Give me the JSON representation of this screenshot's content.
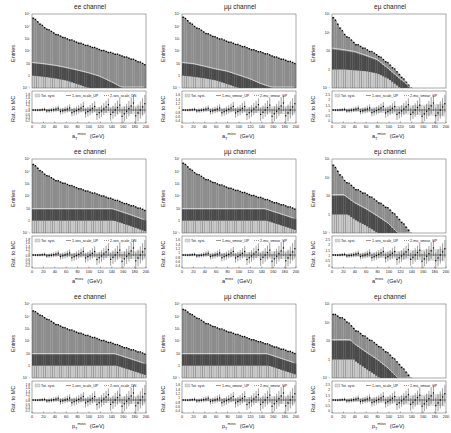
{
  "figure": {
    "rows": [
      {
        "xlabel": "a_T^miss (GeV)",
        "xlabel_main": "a",
        "xlabel_sup": "miss",
        "xlabel_sub": "T",
        "xlabel_unit": "(GeV)"
      },
      {
        "xlabel": "a^miss (GeV)",
        "xlabel_main": "a",
        "xlabel_sup": "miss",
        "xlabel_sub": "",
        "xlabel_unit": "(GeV)"
      },
      {
        "xlabel": "p_T^miss (GeV)",
        "xlabel_main": "p",
        "xlabel_sup": "miss",
        "xlabel_sub": "T",
        "xlabel_unit": "(GeV)"
      }
    ],
    "columns": [
      {
        "title": "ee channel",
        "legend": [
          "Tot. syst.",
          "1-ses_scale_UP",
          "2-ses_scale_DN"
        ],
        "ratio_ticks": [
          "0.2",
          "0.4",
          "0.6",
          "0.8",
          "1",
          "1.2",
          "1.4",
          "1.6",
          "1.8"
        ]
      },
      {
        "title": "μμ channel",
        "legend": [
          "Tot. syst.",
          "1-mu_smear_UP",
          "2-mu_smear_UP"
        ],
        "ratio_ticks": [
          "0.4",
          "0.6",
          "0.8",
          "1",
          "1.2",
          "1.4",
          "1.6"
        ]
      },
      {
        "title": "eμ channel",
        "legend": [
          "Tot. syst.",
          "1-ses_scale_UP",
          "2-mu_smear_UP"
        ],
        "ratio_ticks": [
          "0",
          "0.5",
          "1",
          "1.5",
          "2",
          "2.5"
        ]
      }
    ],
    "ylabel_main": "Entries",
    "ylabel_ratio": "Rat. to MC",
    "x_ticks": [
      "0",
      "20",
      "40",
      "60",
      "80",
      "100",
      "120",
      "140",
      "160",
      "180",
      "200"
    ],
    "y_ticks_log": [
      "10⁻¹",
      "1",
      "10",
      "10²",
      "10³",
      "10⁴",
      "10⁵"
    ]
  },
  "chart_data": [
    {
      "type": "bar",
      "title": "ee channel",
      "xlabel": "a_T^miss (GeV)",
      "ylabel": "Entries",
      "yscale": "log",
      "xlim": [
        0,
        200
      ],
      "ylim": [
        0.1,
        100000
      ],
      "series": [
        {
          "name": "total MC (stacked)",
          "values": [
            50000,
            8000,
            2500,
            1000,
            500,
            250,
            130,
            70,
            40,
            20,
            8
          ]
        },
        {
          "name": "dark component",
          "values": [
            10,
            8,
            6,
            4,
            2.5,
            1.5,
            0.8,
            0.3,
            0.1,
            0.1,
            0.1
          ]
        },
        {
          "name": "light component",
          "values": [
            1,
            0.8,
            0.6,
            0.4,
            0.2,
            0.1,
            0.1,
            0.1,
            0.1,
            0.1,
            0.1
          ]
        }
      ],
      "categories": [
        "0",
        "20",
        "40",
        "60",
        "80",
        "100",
        "120",
        "140",
        "160",
        "180",
        "200"
      ],
      "ratio_ylim": [
        0.2,
        1.8
      ]
    },
    {
      "type": "bar",
      "title": "μμ channel",
      "xlabel": "a_T^miss (GeV)",
      "ylabel": "Entries",
      "yscale": "log",
      "xlim": [
        0,
        200
      ],
      "ylim": [
        0.1,
        100000
      ],
      "series": [
        {
          "name": "total MC (stacked)",
          "values": [
            60000,
            10000,
            3000,
            1200,
            600,
            300,
            150,
            80,
            40,
            20,
            10
          ]
        },
        {
          "name": "dark component",
          "values": [
            10,
            8,
            5,
            3,
            2,
            1,
            0.5,
            0.2,
            0.1,
            0.1,
            0.1
          ]
        },
        {
          "name": "light component",
          "values": [
            1,
            0.8,
            0.6,
            0.4,
            0.2,
            0.1,
            0.1,
            0.1,
            0.1,
            0.1,
            0.1
          ]
        }
      ],
      "categories": [
        "0",
        "20",
        "40",
        "60",
        "80",
        "100",
        "120",
        "140",
        "160",
        "180",
        "200"
      ],
      "ratio_ylim": [
        0.4,
        1.6
      ]
    },
    {
      "type": "bar",
      "title": "eμ channel",
      "xlabel": "a_T^miss (GeV)",
      "ylabel": "Entries",
      "yscale": "log",
      "xlim": [
        0,
        200
      ],
      "ylim": [
        0.1,
        1000
      ],
      "series": [
        {
          "name": "total MC (stacked)",
          "values": [
            700,
            80,
            25,
            12,
            6,
            2,
            0.5,
            0.1,
            0.1,
            0.1,
            0.1
          ]
        },
        {
          "name": "dark component",
          "values": [
            12,
            10,
            8,
            5,
            3,
            1,
            0.3,
            0.1,
            0.1,
            0.1,
            0.1
          ]
        },
        {
          "name": "light component",
          "values": [
            1,
            1,
            0.9,
            0.8,
            0.6,
            0.3,
            0.1,
            0.1,
            0.1,
            0.1,
            0.1
          ]
        }
      ],
      "categories": [
        "0",
        "20",
        "40",
        "60",
        "80",
        "100",
        "120",
        "140",
        "160",
        "180",
        "200"
      ],
      "ratio_ylim": [
        0,
        2.5
      ]
    },
    {
      "type": "bar",
      "title": "ee channel",
      "xlabel": "a^miss (GeV)",
      "ylabel": "Entries",
      "yscale": "log",
      "xlim": [
        0,
        200
      ],
      "ylim": [
        0.1,
        100000
      ],
      "series": [
        {
          "name": "total MC (stacked)",
          "values": [
            40000,
            6000,
            2000,
            900,
            450,
            220,
            120,
            60,
            30,
            15,
            7
          ]
        }
      ],
      "categories": [
        "0",
        "20",
        "40",
        "60",
        "80",
        "100",
        "120",
        "140",
        "160",
        "180",
        "200"
      ],
      "ratio_ylim": [
        0.2,
        1.8
      ]
    },
    {
      "type": "bar",
      "title": "μμ channel",
      "xlabel": "a^miss (GeV)",
      "ylabel": "Entries",
      "yscale": "log",
      "xlim": [
        0,
        200
      ],
      "ylim": [
        0.1,
        100000
      ],
      "series": [
        {
          "name": "total MC (stacked)",
          "values": [
            50000,
            8000,
            2500,
            1000,
            500,
            250,
            130,
            70,
            35,
            18,
            9
          ]
        }
      ],
      "categories": [
        "0",
        "20",
        "40",
        "60",
        "80",
        "100",
        "120",
        "140",
        "160",
        "180",
        "200"
      ],
      "ratio_ylim": [
        0.4,
        1.6
      ]
    },
    {
      "type": "bar",
      "title": "eμ channel",
      "xlabel": "a^miss (GeV)",
      "ylabel": "Entries",
      "yscale": "log",
      "xlim": [
        0,
        200
      ],
      "ylim": [
        0.1,
        1000
      ],
      "series": [
        {
          "name": "total MC (stacked)",
          "values": [
            500,
            70,
            25,
            12,
            5,
            2,
            0.5,
            0.1,
            0.1,
            0.1,
            0.1
          ]
        }
      ],
      "categories": [
        "0",
        "20",
        "40",
        "60",
        "80",
        "100",
        "120",
        "140",
        "160",
        "180",
        "200"
      ],
      "ratio_ylim": [
        0,
        2.5
      ]
    },
    {
      "type": "bar",
      "title": "ee channel",
      "xlabel": "p_T^miss (GeV)",
      "ylabel": "Entries",
      "yscale": "log",
      "xlim": [
        0,
        200
      ],
      "ylim": [
        0.1,
        100000
      ],
      "series": [
        {
          "name": "total MC (stacked)",
          "values": [
            30000,
            8000,
            2500,
            1000,
            500,
            250,
            130,
            70,
            35,
            18,
            9
          ]
        }
      ],
      "categories": [
        "0",
        "20",
        "40",
        "60",
        "80",
        "100",
        "120",
        "140",
        "160",
        "180",
        "200"
      ],
      "ratio_ylim": [
        0.2,
        1.8
      ]
    },
    {
      "type": "bar",
      "title": "μμ channel",
      "xlabel": "p_T^miss (GeV)",
      "ylabel": "Entries",
      "yscale": "log",
      "xlim": [
        0,
        200
      ],
      "ylim": [
        0.1,
        100000
      ],
      "series": [
        {
          "name": "total MC (stacked)",
          "values": [
            40000,
            10000,
            3000,
            1200,
            600,
            300,
            150,
            80,
            40,
            20,
            10
          ]
        }
      ],
      "categories": [
        "0",
        "20",
        "40",
        "60",
        "80",
        "100",
        "120",
        "140",
        "160",
        "180",
        "200"
      ],
      "ratio_ylim": [
        0.4,
        1.6
      ]
    },
    {
      "type": "bar",
      "title": "eμ channel",
      "xlabel": "p_T^miss (GeV)",
      "ylabel": "Entries",
      "yscale": "log",
      "xlim": [
        0,
        200
      ],
      "ylim": [
        0.1,
        1000
      ],
      "series": [
        {
          "name": "total MC (stacked)",
          "values": [
            300,
            150,
            40,
            15,
            6,
            2,
            0.5,
            0.1,
            0.1,
            0.1,
            0.1
          ]
        }
      ],
      "categories": [
        "0",
        "20",
        "40",
        "60",
        "80",
        "100",
        "120",
        "140",
        "160",
        "180",
        "200"
      ],
      "ratio_ylim": [
        0,
        2.5
      ]
    }
  ],
  "colors": {
    "total": "#8c8c8c",
    "dark": "#4a4a4a",
    "light": "#c8c8c8",
    "data": "#000000",
    "band": "#d9d9d9",
    "frame": "#555555"
  }
}
